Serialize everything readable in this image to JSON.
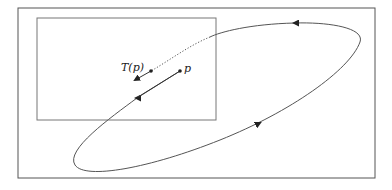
{
  "labels": {
    "tp": "T(p)",
    "p": "p"
  },
  "colors": {
    "stroke": "#555555",
    "ink": "#222222"
  }
}
